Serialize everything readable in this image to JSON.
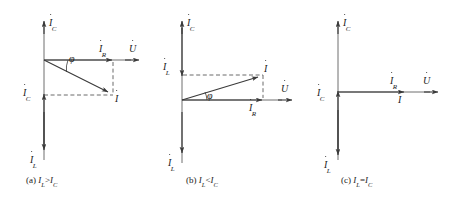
{
  "figure": {
    "stroke_color": "#3a3a3a",
    "text_color": "#1a1a1a",
    "panels": [
      {
        "id": "a",
        "caption_prefix": "(a)",
        "caption_left": "I",
        "caption_left_sub": "L",
        "caption_relation": ">",
        "caption_right": "I",
        "caption_right_sub": "C",
        "angle_symbol": "φ",
        "labels": {
          "ic_top": "I",
          "ic_top_sub": "C",
          "ic_left": "I",
          "ic_left_sub": "C",
          "il_bottom": "I",
          "il_bottom_sub": "L",
          "ir": "I",
          "ir_sub": "R",
          "u": "U",
          "i_total": "I"
        }
      },
      {
        "id": "b",
        "caption_prefix": "(b)",
        "caption_left": "I",
        "caption_left_sub": "L",
        "caption_relation": "<",
        "caption_right": "I",
        "caption_right_sub": "C",
        "angle_symbol": "φ",
        "labels": {
          "ic_top": "I",
          "ic_top_sub": "C",
          "il_left": "I",
          "il_left_sub": "L",
          "il_bottom": "I",
          "il_bottom_sub": "L",
          "ir": "I",
          "ir_sub": "R",
          "u": "U",
          "i_total": "I"
        }
      },
      {
        "id": "c",
        "caption_prefix": "(c)",
        "caption_left": "I",
        "caption_left_sub": "L",
        "caption_relation": "=",
        "caption_right": "I",
        "caption_right_sub": "C",
        "labels": {
          "ic_top": "I",
          "ic_top_sub": "C",
          "ic_left": "I",
          "ic_left_sub": "C",
          "il_bottom": "I",
          "il_bottom_sub": "L",
          "ir": "I",
          "ir_sub": "R",
          "u": "U",
          "i_total": "I"
        }
      }
    ]
  }
}
